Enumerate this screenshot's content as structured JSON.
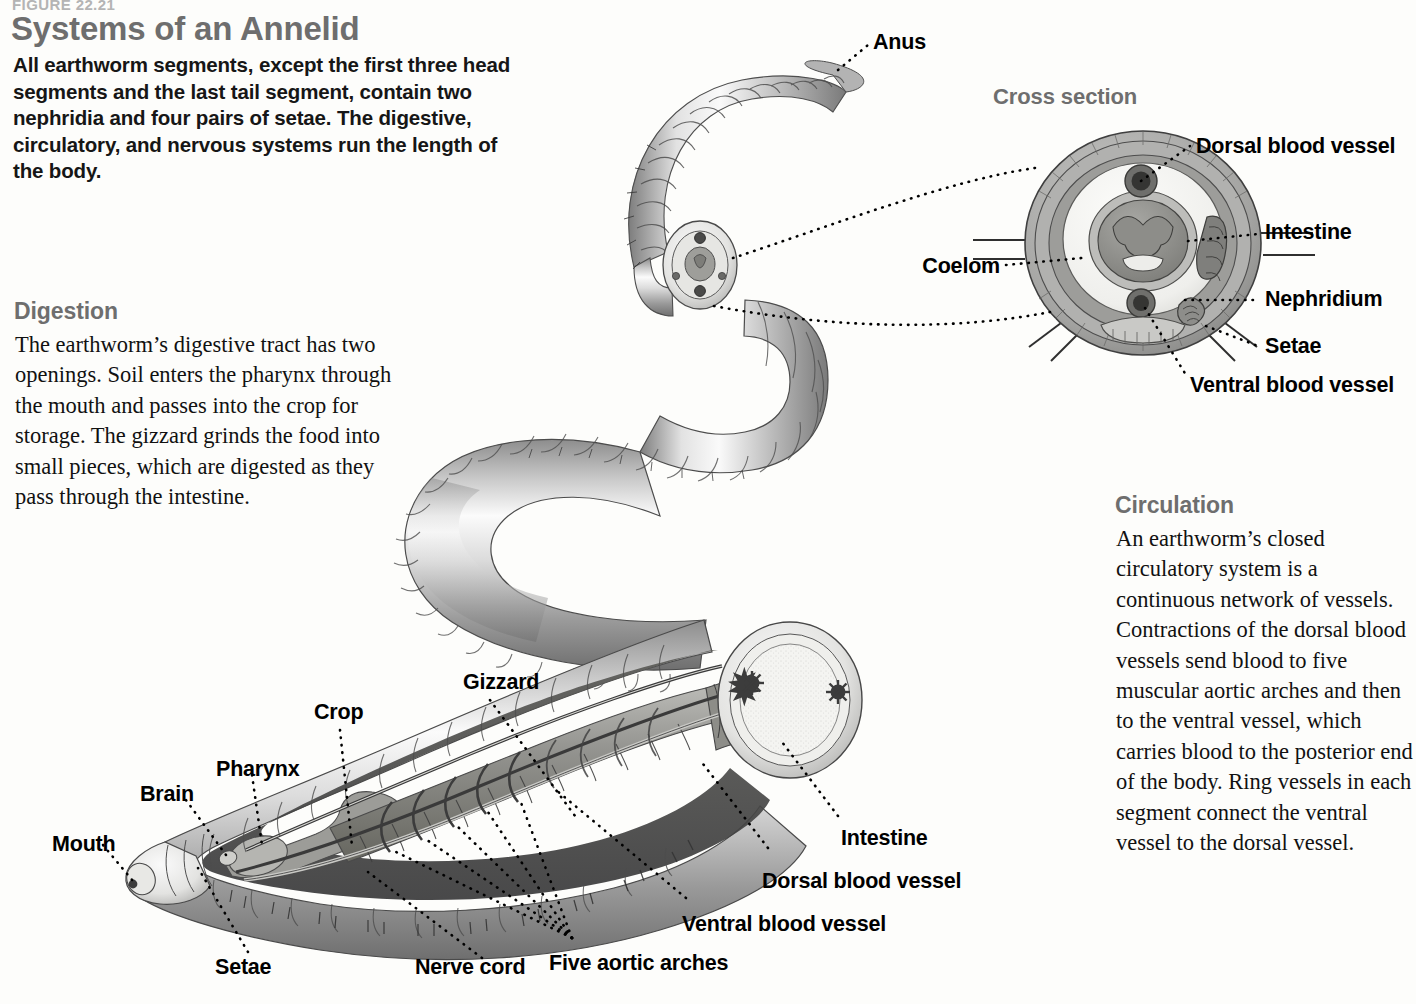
{
  "figure": {
    "number": "FIGURE 22.21",
    "title": "Systems of an Annelid",
    "intro": "All earthworm segments, except the first three head segments and the last tail segment, contain two nephridia and four pairs of setae. The digestive, circulatory, and nervous systems run the length of the body."
  },
  "sections": [
    {
      "id": "digestion",
      "heading": "Digestion",
      "body": "The earthworm’s digestive tract has two openings. Soil enters the pharynx through the mouth and passes into the crop for storage. The gizzard grinds the food into small pieces, which are digested as they pass through the intestine."
    },
    {
      "id": "circulation",
      "heading": "Circulation",
      "body": "An earthworm’s closed circulatory system is a continuous network of vessels. Contractions of the dorsal blood vessels send blood to five muscular aortic arches and then to the ventral vessel, which carries blood to the posterior end of the body. Ring vessels in each segment connect the ventral vessel to the dorsal vessel."
    }
  ],
  "cross_section": {
    "heading": "Cross section",
    "labels": {
      "dorsal_blood_vessel": "Dorsal blood vessel",
      "intestine": "Intestine",
      "nephridium": "Nephridium",
      "setae": "Setae",
      "ventral_blood_vessel": "Ventral blood vessel",
      "coelom": "Coelom"
    }
  },
  "whole_worm": {
    "labels": {
      "anus": "Anus"
    }
  },
  "cutaway": {
    "labels": {
      "mouth": "Mouth",
      "brain": "Brain",
      "pharynx": "Pharynx",
      "crop": "Crop",
      "gizzard": "Gizzard",
      "intestine": "Intestine",
      "dorsal_blood_vessel": "Dorsal blood vessel",
      "ventral_blood_vessel": "Ventral blood vessel",
      "five_aortic_arches": "Five aortic arches",
      "nerve_cord": "Nerve cord",
      "setae": "Setae"
    }
  },
  "colors": {
    "heading_gray": "#6e6e6e",
    "figure_gray": "#b4b4b4",
    "body_text": "#111111",
    "background": "#fdfdfb",
    "leader_line": "#000000"
  }
}
